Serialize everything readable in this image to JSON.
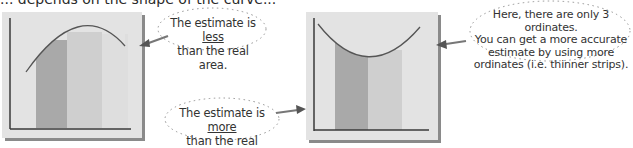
{
  "intro": {
    "text": "... depends on the shape of the curve..."
  },
  "colors": {
    "panel_bg": "#e3e3e3",
    "panel_shadow": "#8a8a8a",
    "axis": "#3a3a3a",
    "strip_dark": "#a9a9a9",
    "strip_mid": "#cfcfcf",
    "strip_light": "#dcdcdc",
    "curve": "#555555",
    "arrow": "#777777"
  },
  "left_graph": {
    "curve_shape": "concave-down",
    "strips": 2
  },
  "right_graph": {
    "curve_shape": "concave-up",
    "strips": 2
  },
  "notes": {
    "less": {
      "line1_prefix": "The estimate is ",
      "line1_emph": "less",
      "line2": "than the real area."
    },
    "more": {
      "line1_prefix": "The estimate is ",
      "line1_emph": "more",
      "line2": "than the real area."
    },
    "ordinates": {
      "line1": "Here, there are only 3 ordinates.",
      "line2": "You can get a more accurate",
      "line3": "estimate by using more",
      "line4": "ordinates (i.e. thinner strips)."
    }
  }
}
